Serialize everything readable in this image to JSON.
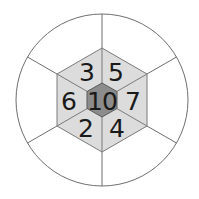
{
  "diagram": {
    "type": "hexagon-in-circle number puzzle",
    "center_value": "10",
    "segments": [
      {
        "position": "top-left",
        "value": "3"
      },
      {
        "position": "top-right",
        "value": "5"
      },
      {
        "position": "right",
        "value": "7"
      },
      {
        "position": "bottom-right",
        "value": "4"
      },
      {
        "position": "bottom-left",
        "value": "2"
      },
      {
        "position": "left",
        "value": "6"
      }
    ],
    "outer_ring_segments": 6,
    "colors": {
      "circle_stroke": "#6e6e6e",
      "outer_fill": "#ffffff",
      "hex_fill": "#dcdcdc",
      "center_fill": "#8c8c8c",
      "text": "#1a1a1a"
    }
  }
}
